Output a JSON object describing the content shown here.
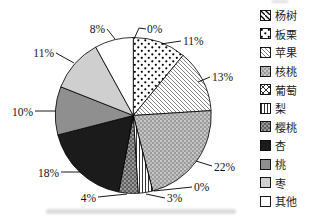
{
  "chart_data": {
    "type": "pie",
    "title": "",
    "unit": "%",
    "legend_position": "right",
    "start_angle_deg": 0,
    "direction": "clockwise",
    "outline_color": "#000000",
    "slices": [
      {
        "label": "杨树",
        "name": "poplar",
        "value": 0,
        "pct_label": "0%",
        "pattern": "diag-thick",
        "color": "#ffffff"
      },
      {
        "label": "板栗",
        "name": "chestnut",
        "value": 11,
        "pct_label": "11%",
        "pattern": "dots",
        "color": "#ffffff"
      },
      {
        "label": "苹果",
        "name": "apple",
        "value": 13,
        "pct_label": "13%",
        "pattern": "diag-thin",
        "color": "#ffffff"
      },
      {
        "label": "核桃",
        "name": "walnut",
        "value": 22,
        "pct_label": "22%",
        "pattern": "fine-dots",
        "color": "#9c9c9c"
      },
      {
        "label": "葡萄",
        "name": "grape",
        "value": 0,
        "pct_label": "0%",
        "pattern": "crosshatch",
        "color": "#ffffff"
      },
      {
        "label": "梨",
        "name": "pear",
        "value": 3,
        "pct_label": "3%",
        "pattern": "vertical-lines",
        "color": "#ffffff"
      },
      {
        "label": "樱桃",
        "name": "cherry",
        "value": 4,
        "pct_label": "4%",
        "pattern": "dark-dots",
        "color": "#606060"
      },
      {
        "label": "杏",
        "name": "apricot",
        "value": 18,
        "pct_label": "18%",
        "pattern": null,
        "color": "#1b1b1b"
      },
      {
        "label": "桃",
        "name": "peach",
        "value": 10,
        "pct_label": "10%",
        "pattern": null,
        "color": "#8f8f8f"
      },
      {
        "label": "枣",
        "name": "jujube",
        "value": 11,
        "pct_label": "11%",
        "pattern": null,
        "color": "#cfcfcf"
      },
      {
        "label": "其他",
        "name": "other",
        "value": 8,
        "pct_label": "8%",
        "pattern": null,
        "color": "#ffffff"
      }
    ]
  }
}
